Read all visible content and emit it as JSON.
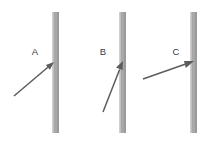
{
  "figure": {
    "width": 214,
    "height": 143,
    "background_color": "#ffffff",
    "line_color": "#5c5c5c",
    "label_color": "#3a3a3a",
    "bar_color": "#a8a8a8",
    "bar_highlight_color": "#cfcfcf",
    "bar_shadow_color": "#9a9a9a"
  },
  "panels": [
    {
      "id": "panel-a",
      "label": "A",
      "label_x": 35,
      "label_y": 55,
      "bar": {
        "x": 52,
        "y": 12,
        "width": 7,
        "height": 121
      },
      "vector": {
        "x1": 14,
        "y1": 96,
        "x2": 54,
        "y2": 62,
        "angle_deg": 40,
        "head_length": 9,
        "head_width": 5
      }
    },
    {
      "id": "panel-b",
      "label": "B",
      "label_x": 103,
      "label_y": 55,
      "bar": {
        "x": 119,
        "y": 12,
        "width": 7,
        "height": 121
      },
      "vector": {
        "x1": 103,
        "y1": 112,
        "x2": 123,
        "y2": 61,
        "angle_deg": 68,
        "head_length": 10,
        "head_width": 5
      }
    },
    {
      "id": "panel-c",
      "label": "C",
      "label_x": 176,
      "label_y": 55,
      "bar": {
        "x": 190,
        "y": 12,
        "width": 7,
        "height": 121
      },
      "vector": {
        "x1": 143,
        "y1": 79,
        "x2": 194,
        "y2": 61,
        "angle_deg": 19,
        "head_length": 10,
        "head_width": 5
      }
    }
  ]
}
